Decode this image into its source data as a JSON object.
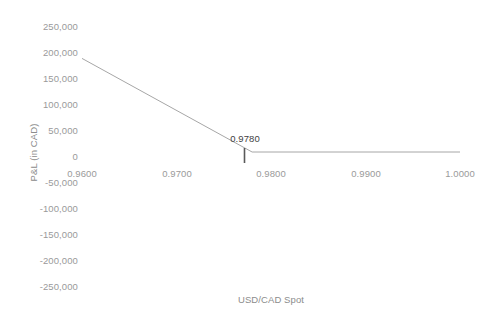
{
  "chart_data": {
    "type": "line",
    "title": "",
    "xlabel": "USD/CAD Spot",
    "ylabel": "P&L (in CAD)",
    "xlim": [
      0.96,
      1.0
    ],
    "ylim": [
      -250000,
      250000
    ],
    "grid": false,
    "legend": null,
    "x_tick_labels": [
      "0.9600",
      "0.9700",
      "0.9800",
      "0.9900",
      "1.0000"
    ],
    "x_tick_values": [
      0.96,
      0.97,
      0.98,
      0.99,
      1.0
    ],
    "y_tick_labels": [
      "250,000",
      "200,000",
      "150,000",
      "100,000",
      "50,000",
      "0",
      "-50,000",
      "-100,000",
      "-150,000",
      "-200,000",
      "-250,000"
    ],
    "y_tick_values": [
      250000,
      200000,
      150000,
      100000,
      50000,
      0,
      -50000,
      -100000,
      -150000,
      -200000,
      -250000
    ],
    "series": [
      {
        "name": "P&L",
        "color": "#a6a6a6",
        "x": [
          0.96,
          0.978,
          1.0
        ],
        "values": [
          180000,
          0,
          0
        ]
      }
    ],
    "annotations": [
      {
        "name": "strike-marker",
        "label": "0.9780",
        "x": 0.978,
        "y": 0,
        "marker": "vertical-tick",
        "marker_color": "#595959",
        "label_color": "#3f3f3f"
      }
    ],
    "colors": {
      "background": "#ffffff",
      "line": "#a6a6a6",
      "axis_text": "#9a9a9a",
      "title_text": "#8c8c8c",
      "annotation_text": "#3f3f3f",
      "marker": "#595959"
    }
  }
}
